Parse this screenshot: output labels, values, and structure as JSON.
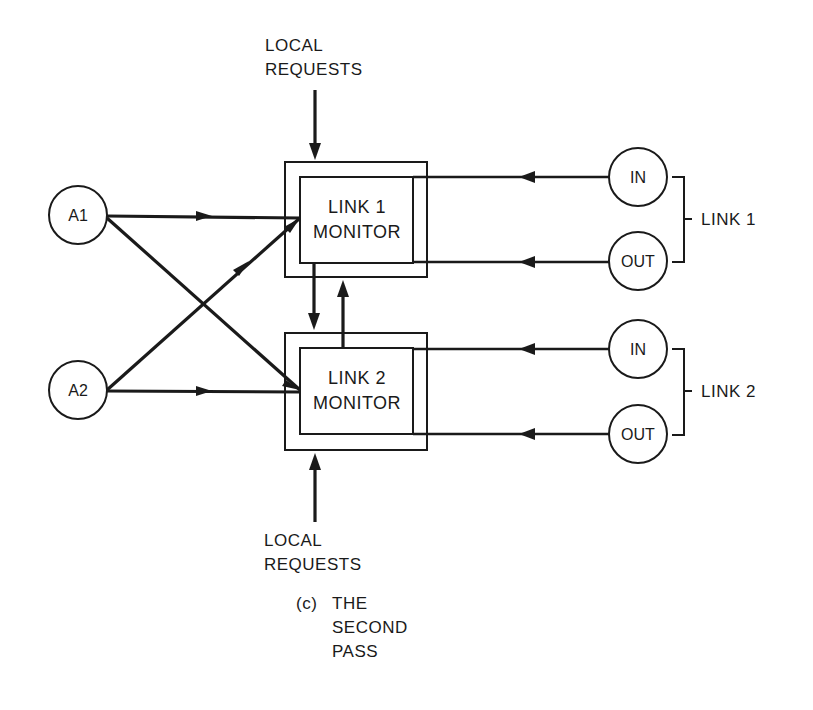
{
  "diagram": {
    "caption": {
      "prefix": "(c)",
      "line1": "THE",
      "line2": "SECOND",
      "line3": "PASS"
    },
    "local_requests_top": {
      "line1": "LOCAL",
      "line2": "REQUESTS"
    },
    "local_requests_bottom": {
      "line1": "LOCAL",
      "line2": "REQUESTS"
    },
    "monitors": [
      {
        "line1": "LINK 1",
        "line2": "MONITOR"
      },
      {
        "line1": "LINK 2",
        "line2": "MONITOR"
      }
    ],
    "agents": [
      {
        "label": "A1"
      },
      {
        "label": "A2"
      }
    ],
    "link_nodes": [
      {
        "in_label": "IN",
        "out_label": "OUT",
        "group_label": "LINK 1"
      },
      {
        "in_label": "IN",
        "out_label": "OUT",
        "group_label": "LINK 2"
      }
    ],
    "edges": [
      {
        "from": "A1",
        "to": "LINK 1 MONITOR"
      },
      {
        "from": "A1",
        "to": "LINK 2 MONITOR"
      },
      {
        "from": "A2",
        "to": "LINK 1 MONITOR"
      },
      {
        "from": "A2",
        "to": "LINK 2 MONITOR"
      },
      {
        "from": "LINK 1 IN",
        "to": "LINK 1 MONITOR"
      },
      {
        "from": "LINK 1 OUT",
        "to": "LINK 1 MONITOR"
      },
      {
        "from": "LINK 2 IN",
        "to": "LINK 2 MONITOR"
      },
      {
        "from": "LINK 2 OUT",
        "to": "LINK 2 MONITOR"
      },
      {
        "from": "LINK 1 MONITOR",
        "to": "LINK 2 MONITOR"
      },
      {
        "from": "LINK 2 MONITOR",
        "to": "LINK 1 MONITOR"
      },
      {
        "from": "LOCAL REQUESTS (top)",
        "to": "LINK 1 MONITOR"
      },
      {
        "from": "LOCAL REQUESTS (bottom)",
        "to": "LINK 2 MONITOR"
      }
    ]
  }
}
